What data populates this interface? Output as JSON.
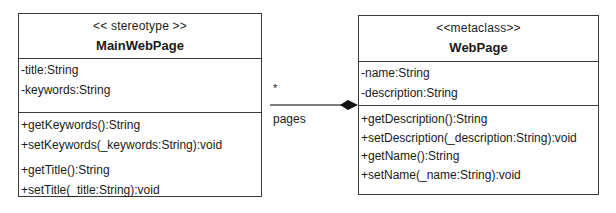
{
  "classes": {
    "main": {
      "stereotype": "<< stereotype >>",
      "name": "MainWebPage",
      "attributes": [
        "-title:String",
        "-keywords:String"
      ],
      "operations": [
        "+getKeywords():String",
        "+setKeywords(_keywords:String):void",
        "+getTitle():String",
        "+setTitle(_title:String):void"
      ]
    },
    "webpage": {
      "stereotype": "<<metaclass>>",
      "name": "WebPage",
      "attributes": [
        "-name:String",
        "-description:String"
      ],
      "operations": [
        "+getDescription():String",
        "+setDescription(_description:String):void",
        "+getName():String",
        "+setName(_name:String):void"
      ]
    }
  },
  "association": {
    "role": "pages",
    "multiplicity": "*",
    "type": "composition"
  }
}
